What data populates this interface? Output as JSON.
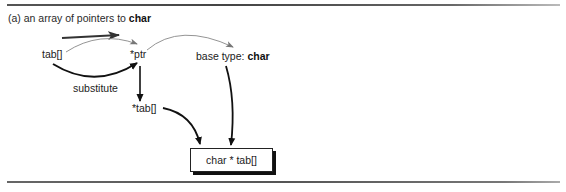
{
  "figure": {
    "heading_prefix": "(a) an array of pointers to ",
    "heading_bold": "char",
    "nodes": {
      "tab": "tab[]",
      "ptr": "*ptr",
      "base_type_prefix": "base type: ",
      "base_type_bold": "char",
      "deref_tab": "*tab[]",
      "result": "char * tab[]"
    },
    "edge_labels": {
      "substitute": "substitute"
    }
  }
}
